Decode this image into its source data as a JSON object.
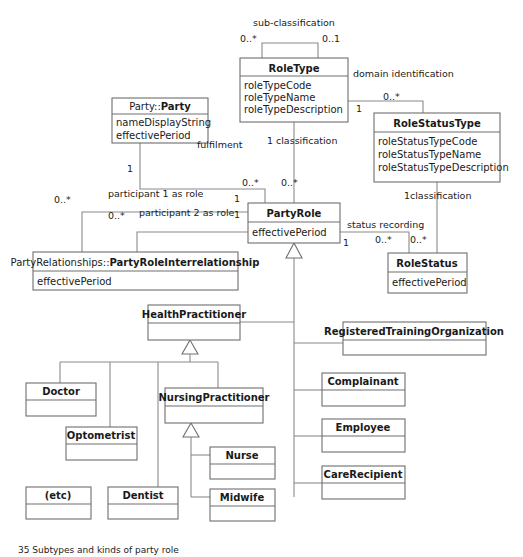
{
  "diagram": {
    "title": "Subtypes and kinds of party role",
    "classes": [
      {
        "id": "roletype",
        "name": "RoleType",
        "prefix": "",
        "attributes": [
          "roleTypeCode",
          "roleTypeName",
          "roleTypeDescription"
        ]
      },
      {
        "id": "rolestatustype",
        "name": "RoleStatusType",
        "prefix": "",
        "attributes": [
          "roleStatusTypeCode",
          "roleStatusTypeName",
          "roleStatusTypeDescription"
        ]
      },
      {
        "id": "party",
        "name": "Party",
        "prefix": "Party::",
        "attributes": [
          "nameDisplayString",
          "effectivePeriod"
        ]
      },
      {
        "id": "partyrole",
        "name": "PartyRole",
        "prefix": "",
        "attributes": [
          "effectivePeriod"
        ]
      },
      {
        "id": "partyroleinterrelationship",
        "name": "PartyRoleInterrelationship",
        "prefix": "PartyRelationships::",
        "attributes": [
          "effectivePeriod"
        ]
      },
      {
        "id": "rolestatus",
        "name": "RoleStatus",
        "prefix": "",
        "attributes": [
          "effectivePeriod"
        ]
      },
      {
        "id": "healthpractitioner",
        "name": "HealthPractitioner",
        "prefix": "",
        "attributes": []
      },
      {
        "id": "registeredtrainingorganization",
        "name": "RegisteredTrainingOrganization",
        "prefix": "",
        "attributes": []
      },
      {
        "id": "doctor",
        "name": "Doctor",
        "prefix": "",
        "attributes": []
      },
      {
        "id": "nursingpractitioner",
        "name": "NursingPractitioner",
        "prefix": "",
        "attributes": []
      },
      {
        "id": "complainant",
        "name": "Complainant",
        "prefix": "",
        "attributes": []
      },
      {
        "id": "optometrist",
        "name": "Optometrist",
        "prefix": "",
        "attributes": []
      },
      {
        "id": "employee",
        "name": "Employee",
        "prefix": "",
        "attributes": []
      },
      {
        "id": "nurse",
        "name": "Nurse",
        "prefix": "",
        "attributes": []
      },
      {
        "id": "etc",
        "name": "(etc)",
        "prefix": "",
        "attributes": []
      },
      {
        "id": "dentist",
        "name": "Dentist",
        "prefix": "",
        "attributes": []
      },
      {
        "id": "midwife",
        "name": "Midwife",
        "prefix": "",
        "attributes": []
      },
      {
        "id": "carerecipient",
        "name": "CareRecipient",
        "prefix": "",
        "attributes": []
      }
    ],
    "association_labels": [
      {
        "id": "sub-classification",
        "text": "sub-classification"
      },
      {
        "id": "domain-identification",
        "text": "domain identification"
      },
      {
        "id": "fulfilment",
        "text": "fulfilment"
      },
      {
        "id": "classification-roletype",
        "text": "classification"
      },
      {
        "id": "participant-1-as-role",
        "text": "participant 1 as role"
      },
      {
        "id": "participant-2-as-role",
        "text": "participant 2 as role"
      },
      {
        "id": "status-recording",
        "text": "status recording"
      },
      {
        "id": "classification-rolestatustype",
        "text": "classification"
      }
    ],
    "multiplicities": [
      {
        "id": "subclass-many",
        "text": "0..*"
      },
      {
        "id": "subclass-one",
        "text": "0..1"
      },
      {
        "id": "domain-ident-many",
        "text": "0..*"
      },
      {
        "id": "domain-ident-one",
        "text": "1"
      },
      {
        "id": "rolestatustype-class-one",
        "text": "1"
      },
      {
        "id": "party-fulfilment-one",
        "text": "1"
      },
      {
        "id": "fulfilment-many",
        "text": "0..*"
      },
      {
        "id": "classification-one",
        "text": "1"
      },
      {
        "id": "classification-many",
        "text": "0..*"
      },
      {
        "id": "participant1-many",
        "text": "0..*"
      },
      {
        "id": "participant2-many",
        "text": "0..*"
      },
      {
        "id": "participant1-one",
        "text": "1"
      },
      {
        "id": "participant2-one",
        "text": "1"
      },
      {
        "id": "status-rec-one",
        "text": "1"
      },
      {
        "id": "status-rec-many",
        "text": "0..*"
      },
      {
        "id": "rolestatus-class-many",
        "text": "0..*"
      }
    ],
    "caption": "35  Subtypes and kinds of party role"
  }
}
